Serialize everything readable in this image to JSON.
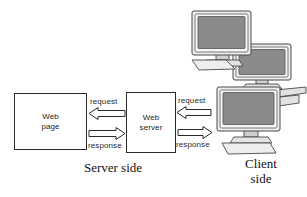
{
  "diagram": {
    "background": "#ffffff",
    "stroke": "#2b2b2b",
    "screen_color": "#8a8a8a",
    "case_color": "#d9d9d9",
    "nodes": {
      "webpage": {
        "line1": "Web",
        "line2": "page"
      },
      "webserver": {
        "line1": "Web",
        "line2": "server"
      }
    },
    "arrows": {
      "left_request": {
        "label": "request",
        "direction": "left"
      },
      "left_response": {
        "label": "response",
        "direction": "right"
      },
      "right_request": {
        "label": "request",
        "direction": "left"
      },
      "right_response": {
        "label": "response",
        "direction": "right"
      }
    },
    "captions": {
      "server_side": "Server side",
      "client_side_line1": "Client",
      "client_side_line2": "side"
    },
    "computers": [
      {
        "name": "client-computer-top"
      },
      {
        "name": "client-computer-middle"
      },
      {
        "name": "client-computer-bottom"
      }
    ]
  }
}
